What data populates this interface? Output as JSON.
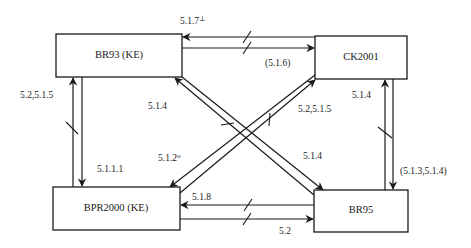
{
  "diagram": {
    "nodes": [
      {
        "id": "br93",
        "label": "BR93 (KE)",
        "x": 56,
        "y": 34,
        "w": 126,
        "h": 43
      },
      {
        "id": "ck2001",
        "label": "CK2001",
        "x": 315,
        "y": 36,
        "w": 92,
        "h": 43
      },
      {
        "id": "bpr2000",
        "label": "BPR2000 (KE)",
        "x": 53,
        "y": 187,
        "w": 127,
        "h": 43
      },
      {
        "id": "br95",
        "label": "BR95",
        "x": 314,
        "y": 190,
        "w": 94,
        "h": 42
      }
    ],
    "edges": [
      {
        "id": "ck2001-to-br93",
        "from": "ck2001",
        "to": "br93",
        "label": "5.1.7",
        "label_sup": "⊥",
        "separating": true
      },
      {
        "id": "br93-to-ck2001",
        "from": "br93",
        "to": "ck2001",
        "label": "(5.1.6)",
        "label_sup": "",
        "separating": true
      },
      {
        "id": "bpr2000-to-br93",
        "from": "bpr2000",
        "to": "br93",
        "label": "5.2,5.1.5",
        "label_sup": "",
        "separating": true
      },
      {
        "id": "br93-to-bpr2000",
        "from": "br93",
        "to": "bpr2000",
        "label": "5.1.1.1",
        "label_sup": "",
        "separating": false
      },
      {
        "id": "br95-to-br93",
        "from": "br95",
        "to": "br93",
        "label": "5.1.4",
        "label_sup": "",
        "separating": true
      },
      {
        "id": "br93-to-br95",
        "from": "br93",
        "to": "br95",
        "label": "5.1.4",
        "label_sup": "",
        "separating": false
      },
      {
        "id": "bpr2000-to-ck2001",
        "from": "bpr2000",
        "to": "ck2001",
        "label": "5.2,5.1.5",
        "label_sup": "",
        "separating": true
      },
      {
        "id": "ck2001-to-bpr2000",
        "from": "ck2001",
        "to": "bpr2000",
        "label": "5.1.2",
        "label_sup": "o",
        "separating": false
      },
      {
        "id": "br95-to-ck2001",
        "from": "br95",
        "to": "ck2001",
        "label": "5.1.4",
        "label_sup": "",
        "separating": true
      },
      {
        "id": "ck2001-to-br95",
        "from": "ck2001",
        "to": "br95",
        "label": "(5.1.3,5.1.4)",
        "label_sup": "",
        "separating": false
      },
      {
        "id": "br95-to-bpr2000",
        "from": "br95",
        "to": "bpr2000",
        "label": "5.1.8",
        "label_sup": "",
        "separating": true
      },
      {
        "id": "bpr2000-to-br95",
        "from": "bpr2000",
        "to": "br95",
        "label": "5.2",
        "label_sup": "",
        "separating": true
      }
    ]
  }
}
